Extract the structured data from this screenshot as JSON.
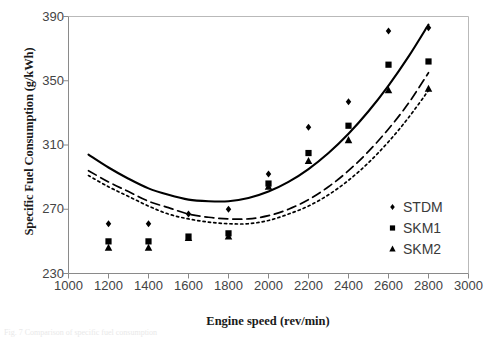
{
  "figure": {
    "caption_fragment": "Fig. 7 Comparison of specific fuel consumption"
  },
  "chart_data": {
    "type": "scatter",
    "title": "",
    "xlabel": "Engine speed (rev/min)",
    "ylabel": "Specific Fuel Consumption (g/kWh)",
    "xlim": [
      1000,
      3000
    ],
    "ylim": [
      230,
      390
    ],
    "xticks": [
      1000,
      1200,
      1400,
      1600,
      1800,
      2000,
      2200,
      2400,
      2600,
      2800,
      3000
    ],
    "yticks": [
      230,
      270,
      310,
      350,
      390
    ],
    "grid": false,
    "legend_position": "center-right",
    "x": [
      1200,
      1400,
      1600,
      1800,
      2000,
      2200,
      2400,
      2600,
      2800
    ],
    "series": [
      {
        "name": "STDM",
        "marker": "diamond",
        "line_style": "solid",
        "color": "#000000",
        "values": [
          261,
          261,
          267,
          270,
          292,
          321,
          337,
          381,
          383
        ],
        "fit_curve": {
          "x": [
            1100,
            1200,
            1300,
            1400,
            1500,
            1600,
            1700,
            1800,
            1900,
            2000,
            2100,
            2200,
            2300,
            2400,
            2500,
            2600,
            2700,
            2800
          ],
          "y": [
            304,
            296,
            289,
            283,
            279,
            276,
            275,
            275,
            277,
            281,
            287,
            295,
            305,
            317,
            331,
            347,
            365,
            385
          ]
        }
      },
      {
        "name": "SKM1",
        "marker": "square",
        "line_style": "dashed",
        "color": "#000000",
        "values": [
          250,
          250,
          253,
          255,
          286,
          305,
          322,
          360,
          362
        ],
        "fit_curve": {
          "x": [
            1100,
            1200,
            1300,
            1400,
            1500,
            1600,
            1700,
            1800,
            1900,
            2000,
            2100,
            2200,
            2300,
            2400,
            2500,
            2600,
            2700,
            2800
          ],
          "y": [
            294,
            287,
            281,
            275,
            271,
            267,
            265,
            264,
            264,
            266,
            270,
            276,
            284,
            294,
            306,
            320,
            336,
            355
          ]
        }
      },
      {
        "name": "SKM2",
        "marker": "triangle",
        "line_style": "dotted",
        "color": "#000000",
        "values": [
          246,
          246,
          252,
          253,
          284,
          300,
          313,
          344,
          345
        ],
        "fit_curve": {
          "x": [
            1100,
            1200,
            1300,
            1400,
            1500,
            1600,
            1700,
            1800,
            1900,
            2000,
            2100,
            2200,
            2300,
            2400,
            2500,
            2600,
            2700,
            2800
          ],
          "y": [
            291,
            284,
            278,
            272,
            267,
            264,
            262,
            261,
            261,
            263,
            267,
            272,
            279,
            288,
            299,
            312,
            327,
            344
          ]
        }
      }
    ]
  },
  "legend": {
    "items": [
      {
        "label": "STDM",
        "marker": "diamond-marker"
      },
      {
        "label": "SKM1",
        "marker": "square-marker"
      },
      {
        "label": "SKM2",
        "marker": "triangle-marker"
      }
    ]
  }
}
